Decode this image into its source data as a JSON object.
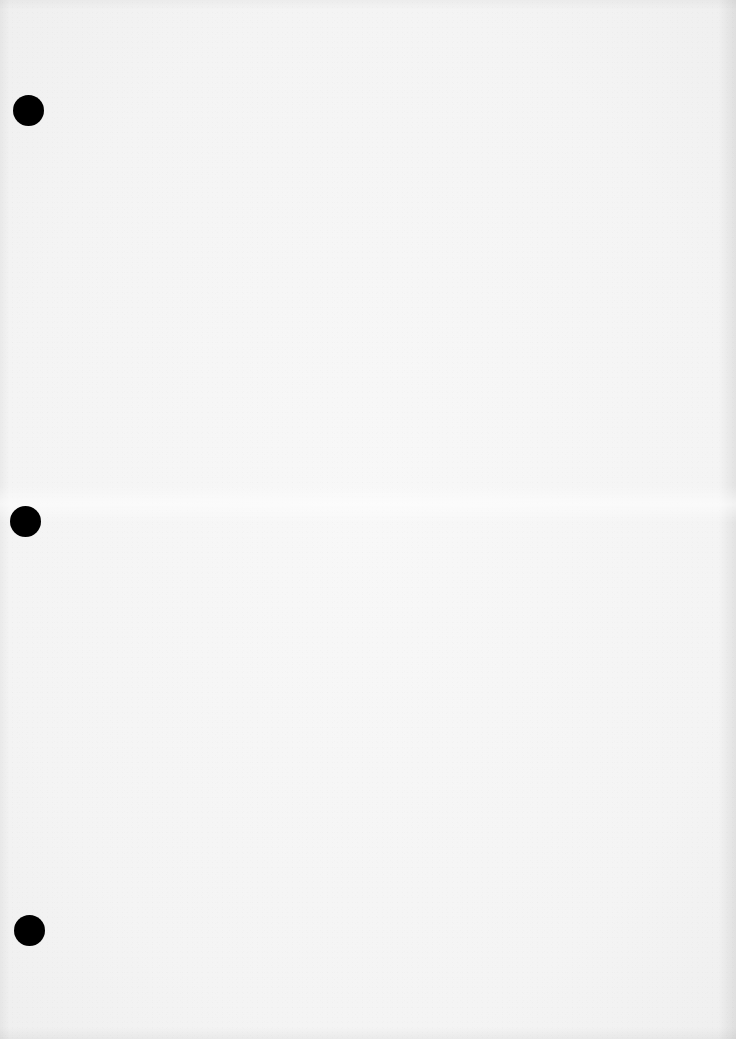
{
  "document": {
    "type": "blank scanned sheet",
    "text_content": "",
    "paper_color": "#f4f4f4",
    "punch_hole_color": "#000000",
    "punch_holes": [
      {
        "cx": 28,
        "cy": 110,
        "diameter": 31
      },
      {
        "cx": 25,
        "cy": 521,
        "diameter": 31
      },
      {
        "cx": 29,
        "cy": 930,
        "diameter": 31
      }
    ]
  }
}
